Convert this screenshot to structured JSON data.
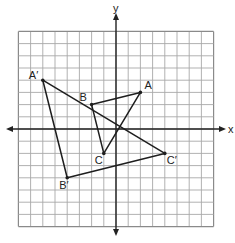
{
  "figure": {
    "width": 235,
    "height": 243,
    "origin_px": [
      116,
      129
    ],
    "unit_px": 12.2,
    "grid": {
      "xmin": -8,
      "xmax": 8,
      "ymin": -8,
      "ymax": 8,
      "color": "#a8a8a8",
      "border_color": "#8a8a8a"
    },
    "axis_color": "#222222",
    "line_color": "#1e1e1e"
  },
  "axes": {
    "x_label": "x",
    "y_label": "y"
  },
  "triangles": [
    {
      "name": "ABC",
      "vertices": [
        {
          "label": "A",
          "x": 2,
          "y": 3,
          "label_dx": 4,
          "label_dy": -3
        },
        {
          "label": "B",
          "x": -2,
          "y": 2,
          "label_dx": -12,
          "label_dy": -4
        },
        {
          "label": "C",
          "x": -1,
          "y": -2,
          "label_dx": -9,
          "label_dy": 11
        }
      ]
    },
    {
      "name": "A'B'C'",
      "vertices": [
        {
          "label": "A′",
          "x": -6,
          "y": 4,
          "label_dx": -14,
          "label_dy": -1
        },
        {
          "label": "B′",
          "x": -4,
          "y": -4,
          "label_dx": -8,
          "label_dy": 11
        },
        {
          "label": "C′",
          "x": 4,
          "y": -2,
          "label_dx": 2,
          "label_dy": 11
        }
      ]
    }
  ]
}
